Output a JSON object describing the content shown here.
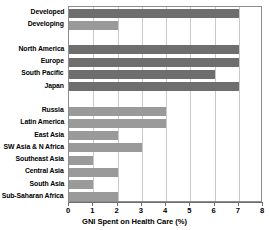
{
  "chart_data": {
    "type": "bar",
    "orientation": "horizontal",
    "title": "",
    "xlabel": "GNI Spent on Health Care (%)",
    "ylabel": "",
    "xlim": [
      0,
      8
    ],
    "xticks": [
      "0",
      "1",
      "2",
      "3",
      "4",
      "5",
      "6",
      "7",
      "8"
    ],
    "grid": "vertical",
    "legend": "none",
    "colors": {
      "developed": "#6e6e6e",
      "developing": "#9a9a9a",
      "gridline": "#c9c9c9",
      "frame": "#8d8d8d",
      "text": "#000000",
      "background": "#ffffff"
    },
    "groups": [
      {
        "name": "summary",
        "bars": [
          {
            "label": "Developed",
            "value": 7,
            "color_key": "developed"
          },
          {
            "label": "Developing",
            "value": 2,
            "color_key": "developing"
          }
        ]
      },
      {
        "name": "developed-regions",
        "bars": [
          {
            "label": "North America",
            "value": 7,
            "color_key": "developed"
          },
          {
            "label": "Europe",
            "value": 7,
            "color_key": "developed"
          },
          {
            "label": "South Pacific",
            "value": 6,
            "color_key": "developed"
          },
          {
            "label": "Japan",
            "value": 7,
            "color_key": "developed"
          }
        ]
      },
      {
        "name": "developing-regions",
        "bars": [
          {
            "label": "Russia",
            "value": 4,
            "color_key": "developing"
          },
          {
            "label": "Latin America",
            "value": 4,
            "color_key": "developing"
          },
          {
            "label": "East Asia",
            "value": 2,
            "color_key": "developing"
          },
          {
            "label": "SW Asia & N Africa",
            "value": 3,
            "color_key": "developing"
          },
          {
            "label": "Southeast Asia",
            "value": 1,
            "color_key": "developing"
          },
          {
            "label": "Central Asia",
            "value": 2,
            "color_key": "developing"
          },
          {
            "label": "South Asia",
            "value": 1,
            "color_key": "developing"
          },
          {
            "label": "Sub-Saharan Africa",
            "value": 2,
            "color_key": "developing"
          }
        ]
      }
    ]
  }
}
